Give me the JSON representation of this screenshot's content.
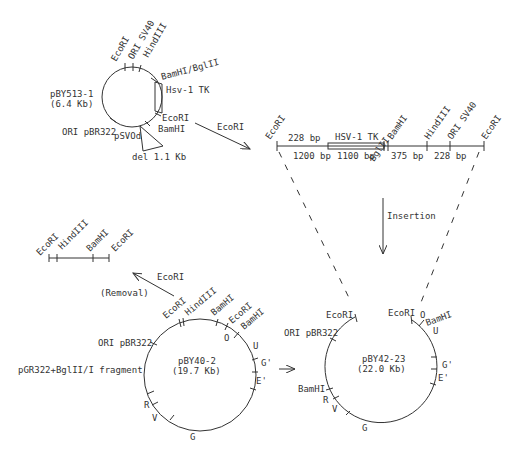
{
  "plasmid_1": {
    "name": "pBY513-1",
    "size": "(6.4 Kb)",
    "sites": {
      "ecori_top": "EcoRI",
      "ori_sv40": "ORI SV40",
      "hindiii": "HindIII",
      "bamhi_bglii": "BamHI/BglII",
      "hsv_tk": "Hsv-1 TK",
      "ecori_right": "EcoRI",
      "bamhi": "BamHI",
      "ori_pbr322": "ORI pBR322",
      "psvod": "pSVOd",
      "deletion": "del 1.1 Kb"
    }
  },
  "arrow_1_label": "EcoRI",
  "fragment": {
    "sites": [
      "EcoRI",
      "BamHI",
      "BglII",
      "HindIII",
      "ORI SV40",
      "EcoRI"
    ],
    "top_label_228": "228 bp",
    "hsv_tk": "HSV-1 TK",
    "seg_1200": "1200 bp",
    "seg_1100": "1100 bp",
    "seg_375": "375 bp",
    "seg_228": "228 bp"
  },
  "insertion_label": "Insertion",
  "removed_fragment": {
    "sites": [
      "EcoRI",
      "HindIII",
      "BamHI",
      "EcoRI"
    ]
  },
  "arrow_2_label": "EcoRI",
  "removal_label": "(Removal)",
  "plasmid_2": {
    "name": "pBY40-2",
    "size": "(19.7 Kb)",
    "left_label": "pGR322+BglII/I fragment",
    "sites": {
      "ecori": "EcoRI",
      "hindiii": "HindIII",
      "bamhi": "BamHI",
      "ecori2": "EcoRI",
      "bamhi2": "BamHI",
      "ori_pbr322": "ORI pBR322",
      "o": "O",
      "u": "U",
      "g_prime": "G'",
      "e_prime": "E'",
      "r": "R",
      "v": "V",
      "g": "G"
    }
  },
  "plasmid_3": {
    "name": "pBY42-23",
    "size": "(22.0 Kb)",
    "sites": {
      "ecori_left": "EcoRI",
      "ecori_right": "EcoRI",
      "o": "O",
      "bamhi_top": "BamHI",
      "ori_pbr322": "ORI pBR322",
      "u": "U",
      "g_prime": "G'",
      "e_prime": "E'",
      "bamhi": "BamHI",
      "r": "R",
      "v": "V",
      "g": "G"
    }
  }
}
